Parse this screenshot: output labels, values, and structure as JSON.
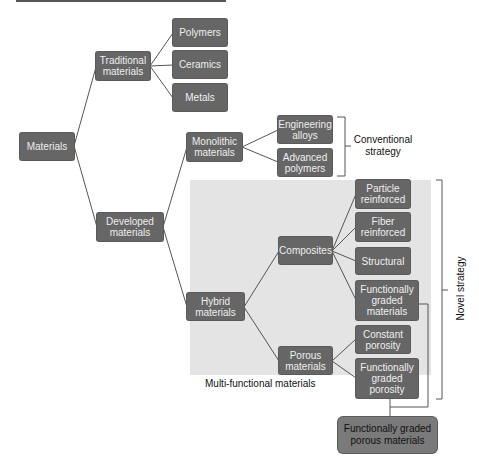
{
  "diagram": {
    "root": {
      "label": "Materials"
    },
    "traditional": {
      "label": "Traditional materials",
      "children": [
        "Polymers",
        "Ceramics",
        "Metals"
      ]
    },
    "developed": {
      "label": "Developed materials"
    },
    "monolithic": {
      "label": "Monolithic materials",
      "children": [
        "Engineering alloys",
        "Advanced polymers"
      ]
    },
    "hybrid": {
      "label": "Hybrid materials"
    },
    "composites": {
      "label": "Composites",
      "children": [
        "Particle reinforced",
        "Fiber reinforced",
        "Structural",
        "Functionally graded materials"
      ]
    },
    "porous": {
      "label": "Porous materials",
      "children": [
        "Constant porosity",
        "Functionally graded porosity"
      ]
    },
    "region_label": "Multi-functional materials",
    "conventional_label": "Conventional strategy",
    "novel_label": "Novel strategy",
    "result": {
      "label": "Functionally graded porous materials"
    }
  },
  "colors": {
    "node_fill": "#666666",
    "node_text": "#eeeeee",
    "region_fill": "#e4e4e4",
    "result_fill": "#7a7a7a",
    "line": "#555555"
  }
}
